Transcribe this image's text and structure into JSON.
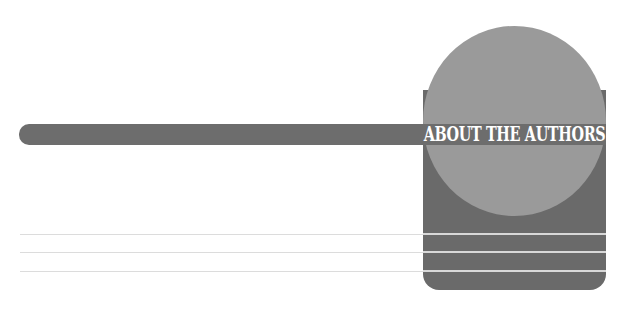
{
  "heading": {
    "title": "ABOUT THE AUTHORS"
  },
  "colors": {
    "background": "#ffffff",
    "bar": "#6d6d6d",
    "box": "#6a6a6a",
    "circle": "#9a9a9a",
    "title_text": "#ffffff",
    "box_lines": "#d8d8d8",
    "rules": "#dcdcdc"
  },
  "rules_y": [
    234,
    252,
    271
  ]
}
